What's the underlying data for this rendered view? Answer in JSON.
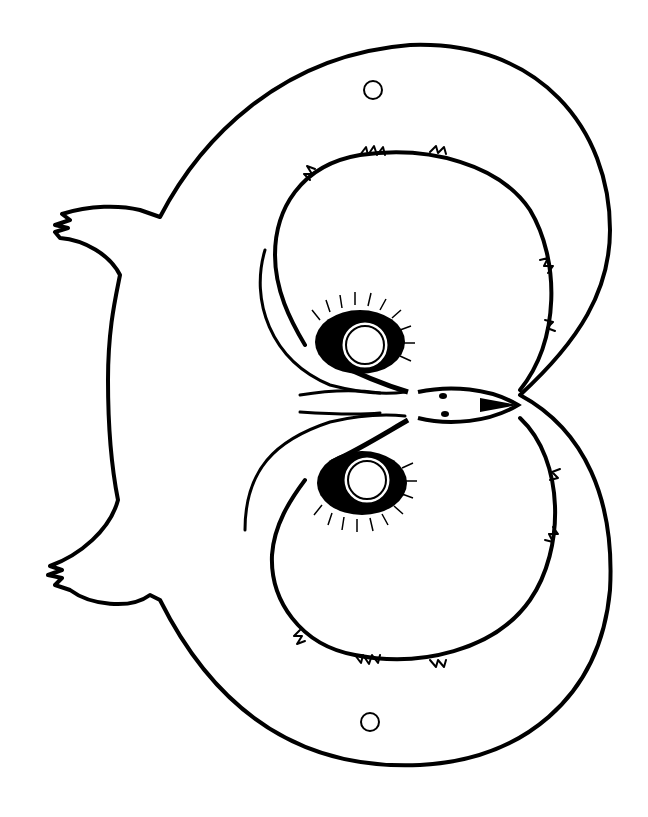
{
  "image": {
    "subject": "owl mask coloring page outline (rotated 90°)",
    "background": "#ffffff",
    "line_color": "#000000",
    "elements": [
      {
        "name": "mask-outline",
        "shape": "owl head silhouette with two ear tufts on left"
      },
      {
        "name": "string-hole-top",
        "shape": "circle",
        "cx": 373,
        "cy": 90,
        "r": 9
      },
      {
        "name": "string-hole-bottom",
        "shape": "circle",
        "cx": 370,
        "cy": 722,
        "r": 9
      },
      {
        "name": "eye-hole-top",
        "shape": "circle",
        "cx": 365,
        "cy": 345,
        "r": 22
      },
      {
        "name": "eye-hole-bottom",
        "shape": "circle",
        "cx": 367,
        "cy": 480,
        "r": 22
      },
      {
        "name": "beak",
        "shape": "pointed beak pointing right",
        "tip": [
          518,
          405
        ]
      },
      {
        "name": "feather-brow-top",
        "shape": "fluffy arc"
      },
      {
        "name": "feather-brow-bottom",
        "shape": "fluffy arc"
      }
    ]
  }
}
